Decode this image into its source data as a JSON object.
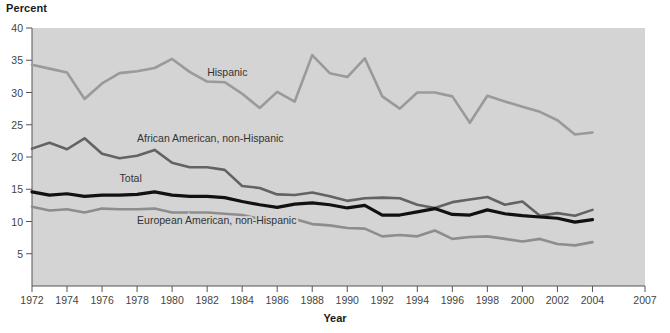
{
  "chart_data": {
    "type": "line",
    "title": "",
    "xlabel": "Year",
    "ylabel": "Percent",
    "xlim": [
      1972,
      2007
    ],
    "ylim": [
      0,
      40
    ],
    "yticks": [
      5,
      10,
      15,
      20,
      25,
      30,
      35,
      40
    ],
    "xticks": [
      1972,
      1974,
      1976,
      1978,
      1980,
      1982,
      1984,
      1986,
      1988,
      1990,
      1992,
      1994,
      1996,
      1998,
      2000,
      2002,
      2004,
      2007
    ],
    "grid": false,
    "legend_position": "inline-labels",
    "plot_background": "#d4d4d4",
    "x": [
      1972,
      1973,
      1974,
      1975,
      1976,
      1977,
      1978,
      1979,
      1980,
      1981,
      1982,
      1983,
      1984,
      1985,
      1986,
      1987,
      1988,
      1989,
      1990,
      1991,
      1992,
      1993,
      1994,
      1995,
      1996,
      1997,
      1998,
      1999,
      2000,
      2001,
      2002,
      2003,
      2004
    ],
    "series": [
      {
        "name": "Hispanic",
        "color": "#9a9a9a",
        "label_x": 1982,
        "label_y": 32.5,
        "values": [
          34.3,
          33.7,
          33.1,
          29.0,
          31.4,
          33.0,
          33.3,
          33.8,
          35.2,
          33.2,
          31.7,
          31.6,
          29.8,
          27.6,
          30.1,
          28.6,
          35.8,
          33.0,
          32.4,
          35.3,
          29.4,
          27.5,
          30.0,
          30.0,
          29.4,
          25.3,
          29.5,
          28.6,
          27.8,
          27.0,
          25.7,
          23.5,
          23.8
        ]
      },
      {
        "name": "African American, non-Hispanic",
        "color": "#636363",
        "label_x": 1978,
        "label_y": 22.3,
        "values": [
          21.3,
          22.2,
          21.2,
          22.9,
          20.5,
          19.8,
          20.2,
          21.1,
          19.1,
          18.4,
          18.4,
          18.0,
          15.5,
          15.2,
          14.2,
          14.1,
          14.5,
          13.9,
          13.2,
          13.6,
          13.7,
          13.6,
          12.6,
          12.1,
          13.0,
          13.4,
          13.8,
          12.6,
          13.1,
          10.9,
          11.3,
          10.9,
          11.8
        ]
      },
      {
        "name": "Total",
        "color": "#111111",
        "label_x": 1977,
        "label_y": 16.2,
        "values": [
          14.6,
          14.1,
          14.3,
          13.9,
          14.1,
          14.1,
          14.2,
          14.6,
          14.1,
          13.9,
          13.9,
          13.7,
          13.1,
          12.6,
          12.2,
          12.7,
          12.9,
          12.6,
          12.1,
          12.5,
          11.0,
          11.0,
          11.5,
          12.0,
          11.1,
          11.0,
          11.8,
          11.2,
          10.9,
          10.7,
          10.5,
          9.9,
          10.3
        ]
      },
      {
        "name": "European American, non-Hispanic",
        "color": "#8d8d8d",
        "label_x": 1978,
        "label_y": 9.6,
        "values": [
          12.3,
          11.7,
          11.9,
          11.4,
          12.0,
          11.9,
          11.9,
          12.0,
          11.4,
          11.4,
          11.4,
          11.2,
          11.0,
          10.4,
          9.7,
          10.4,
          9.6,
          9.4,
          9.0,
          8.9,
          7.7,
          7.9,
          7.7,
          8.6,
          7.3,
          7.6,
          7.7,
          7.3,
          6.9,
          7.3,
          6.5,
          6.3,
          6.8
        ]
      }
    ]
  }
}
